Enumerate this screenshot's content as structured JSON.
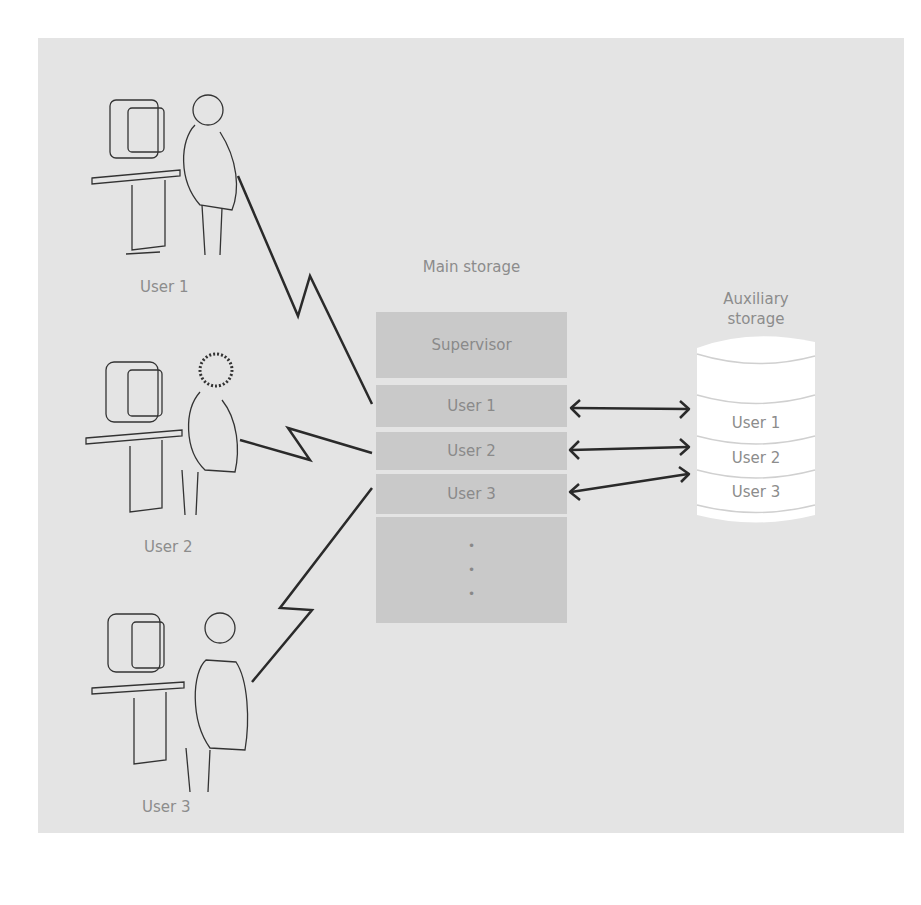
{
  "diagram": {
    "users": [
      {
        "label": "User 1"
      },
      {
        "label": "User 2"
      },
      {
        "label": "User 3"
      }
    ],
    "main_storage": {
      "title": "Main storage",
      "blocks": [
        "Supervisor",
        "User 1",
        "User 2",
        "User 3"
      ],
      "ellipsis": "•"
    },
    "auxiliary_storage": {
      "title_line1": "Auxiliary",
      "title_line2": "storage",
      "segments": [
        "User 1",
        "User 2",
        "User 3"
      ]
    },
    "colors": {
      "panel": "#e4e4e4",
      "block": "#c9c9c9",
      "text": "#8c8c8c",
      "line": "#2a2a2a",
      "cylinder": "#ffffff"
    }
  }
}
